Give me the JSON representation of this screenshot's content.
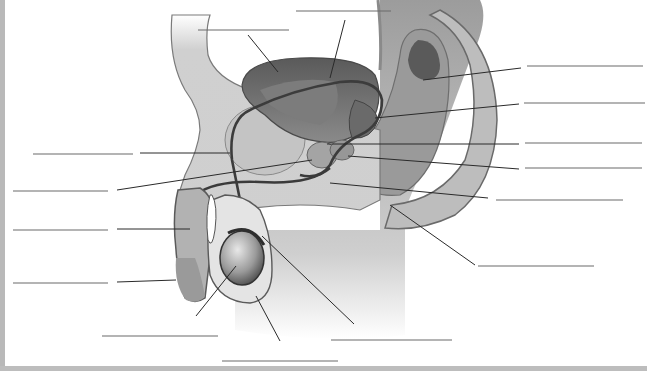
{
  "diagram": {
    "style": "grayscale illustration with blank label lines",
    "colors": {
      "background": "#ffffff",
      "border": "#b9b9b9",
      "tissue_light": "#d6d6d6",
      "tissue_mid": "#a8a8a8",
      "tissue_dark": "#5e5e5e",
      "duct": "#3c3c3c",
      "label_line": "#6a6a6a"
    },
    "labels": [
      {
        "id": "label-1",
        "text": "",
        "line": [
          296,
          11,
          391,
          11
        ],
        "leader": [
          345,
          20,
          330,
          78
        ]
      },
      {
        "id": "label-2",
        "text": "",
        "line": [
          198,
          30,
          289,
          30
        ],
        "leader": [
          248,
          35,
          278,
          72
        ]
      },
      {
        "id": "label-3",
        "text": "",
        "line": [
          527,
          66,
          643,
          66
        ],
        "leader": [
          521,
          68,
          423,
          80
        ]
      },
      {
        "id": "label-4",
        "text": "",
        "line": [
          524,
          103,
          645,
          103
        ],
        "leader": [
          519,
          104,
          375,
          118
        ]
      },
      {
        "id": "label-5",
        "text": "",
        "line": [
          33,
          154,
          133,
          154
        ],
        "leader": [
          140,
          153,
          230,
          153
        ]
      },
      {
        "id": "label-6",
        "text": "",
        "line": [
          525,
          143,
          642,
          143
        ],
        "leader": [
          519,
          144,
          327,
          144
        ]
      },
      {
        "id": "label-7",
        "text": "",
        "line": [
          525,
          168,
          642,
          168
        ],
        "leader": [
          519,
          169,
          348,
          156
        ]
      },
      {
        "id": "label-8",
        "text": "",
        "line": [
          13,
          191,
          108,
          191
        ],
        "leader": [
          117,
          190,
          312,
          160
        ]
      },
      {
        "id": "label-9",
        "text": "",
        "line": [
          496,
          200,
          623,
          200
        ],
        "leader": [
          488,
          198,
          330,
          183
        ]
      },
      {
        "id": "label-10",
        "text": "",
        "line": [
          13,
          230,
          108,
          230
        ],
        "leader": [
          117,
          229,
          190,
          229
        ]
      },
      {
        "id": "label-11",
        "text": "",
        "line": [
          478,
          266,
          594,
          266
        ],
        "leader": [
          475,
          265,
          390,
          205
        ]
      },
      {
        "id": "label-12",
        "text": "",
        "line": [
          13,
          283,
          108,
          283
        ],
        "leader": [
          117,
          282,
          176,
          280
        ]
      },
      {
        "id": "label-13",
        "text": "",
        "line": [
          102,
          336,
          218,
          336
        ],
        "leader": [
          196,
          316,
          236,
          266
        ]
      },
      {
        "id": "label-14",
        "text": "",
        "line": [
          331,
          340,
          452,
          340
        ],
        "leader": [
          354,
          324,
          262,
          236
        ]
      },
      {
        "id": "label-15",
        "text": "",
        "line": [
          222,
          361,
          338,
          361
        ],
        "leader": [
          280,
          341,
          256,
          296
        ]
      }
    ]
  }
}
